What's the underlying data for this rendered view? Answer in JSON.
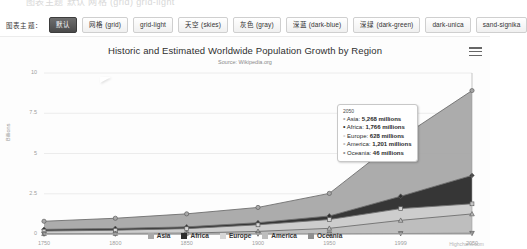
{
  "top_strip": {
    "ghost_text": "图表主题  默认  网格 (grid)  grid-light"
  },
  "theme_bar": {
    "label": "图表主题：",
    "buttons": [
      {
        "label": "默认",
        "active": true
      },
      {
        "label": "网格 (grid)",
        "active": false
      },
      {
        "label": "grid-light",
        "active": false
      },
      {
        "label": "天空 (skies)",
        "active": false
      },
      {
        "label": "灰色 (gray)",
        "active": false
      },
      {
        "label": "深蓝 (dark-blue)",
        "active": false
      },
      {
        "label": "深绿 (dark-green)",
        "active": false
      },
      {
        "label": "dark-unica",
        "active": false
      },
      {
        "label": "sand-signika",
        "active": false
      }
    ]
  },
  "chart": {
    "title": "Historic and Estimated Worldwide Population Growth by Region",
    "subtitle": "Source: Wikipedia.org",
    "menu_icon": "hamburger-menu-icon",
    "credits": "Highcharts.com"
  },
  "tooltip": {
    "header": "2050",
    "rows": [
      {
        "bullet": "•",
        "name": "Asia",
        "value": "5,268 millions",
        "color": "#a8a8a8"
      },
      {
        "bullet": "•",
        "name": "Africa",
        "value": "1,766 millions",
        "color": "#2f2f2f"
      },
      {
        "bullet": "•",
        "name": "Europe",
        "value": "628 millions",
        "color": "#d6d6d6"
      },
      {
        "bullet": "•",
        "name": "America",
        "value": "1,201 millions",
        "color": "#bdbdbd"
      },
      {
        "bullet": "•",
        "name": "Oceania",
        "value": "46 millions",
        "color": "#8f8f8f"
      }
    ]
  },
  "chart_data": {
    "type": "area",
    "stacked": true,
    "title": "Historic and Estimated Worldwide Population Growth by Region",
    "subtitle": "Source: Wikipedia.org",
    "xlabel": "",
    "ylabel": "Billions",
    "categories": [
      "1750",
      "1800",
      "1850",
      "1900",
      "1950",
      "1999",
      "2050"
    ],
    "ylim": [
      0,
      10
    ],
    "yticks": [
      0,
      2.5,
      5,
      7.5,
      10
    ],
    "ytick_labels": [
      "0",
      "2.5",
      "5",
      "7.5",
      "10"
    ],
    "grid": true,
    "legend_position": "bottom",
    "units": "millions",
    "series": [
      {
        "name": "Asia",
        "color": "#a8a8a8",
        "marker": "circle",
        "values": [
          502,
          635,
          809,
          947,
          1402,
          3634,
          5268
        ]
      },
      {
        "name": "Africa",
        "color": "#2f2f2f",
        "marker": "diamond",
        "values": [
          106,
          107,
          111,
          133,
          221,
          767,
          1766
        ]
      },
      {
        "name": "Europe",
        "color": "#d6d6d6",
        "marker": "square",
        "values": [
          163,
          203,
          276,
          408,
          547,
          729,
          628
        ]
      },
      {
        "name": "America",
        "color": "#bdbdbd",
        "marker": "triangle",
        "values": [
          18,
          31,
          54,
          156,
          339,
          818,
          1201
        ]
      },
      {
        "name": "Oceania",
        "color": "#8f8f8f",
        "marker": "triangle-down",
        "values": [
          2,
          2,
          2,
          6,
          13,
          30,
          46
        ]
      }
    ]
  }
}
